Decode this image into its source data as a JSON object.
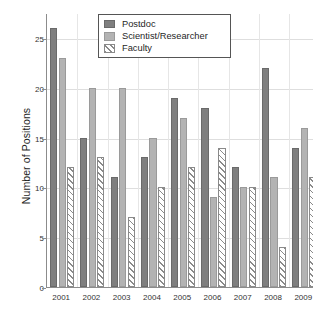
{
  "chart_data": {
    "type": "bar",
    "title": "",
    "xlabel": "",
    "ylabel": "Number of Positions",
    "categories": [
      "2001",
      "2002",
      "2003",
      "2004",
      "2005",
      "2006",
      "2007",
      "2008",
      "2009"
    ],
    "series": [
      {
        "name": "Postdoc",
        "color": "#7f7f7f",
        "values": [
          26,
          15,
          11,
          13,
          19,
          18,
          12,
          22,
          14
        ]
      },
      {
        "name": "Scientist/Researcher",
        "color": "#b3b3b3",
        "values": [
          23,
          20,
          20,
          15,
          17,
          9,
          10,
          11,
          16
        ]
      },
      {
        "name": "Faculty",
        "color": "#ffffff",
        "values": [
          12,
          13,
          7,
          10,
          12,
          14,
          10,
          4,
          11
        ]
      }
    ],
    "ylim": [
      0,
      27.5
    ],
    "yticks": [
      0,
      5,
      10,
      15,
      20,
      25
    ],
    "ytick_labels": [
      "0",
      "5",
      "10",
      "15",
      "20",
      "25"
    ],
    "grid": "horizontal-and-vertical",
    "legend_position": "top-center"
  },
  "axis": {
    "y_title": "Number of Positions"
  },
  "legend": {
    "entries": [
      {
        "label": "Postdoc"
      },
      {
        "label": "Scientist/Researcher"
      },
      {
        "label": "Faculty"
      }
    ]
  }
}
